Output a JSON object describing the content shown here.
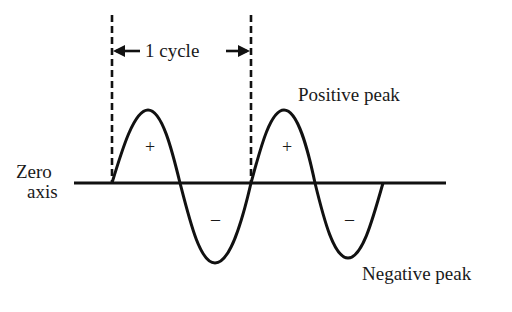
{
  "diagram": {
    "type": "sine-wave-cycle",
    "labels": {
      "cycle": "1 cycle",
      "positive_peak": "Positive peak",
      "negative_peak": "Negative peak",
      "zero_axis_line1": "Zero",
      "zero_axis_line2": "axis"
    },
    "signs": {
      "positive": "+",
      "negative": "–"
    },
    "colors": {
      "stroke": "#111111",
      "background": "#ffffff"
    }
  }
}
